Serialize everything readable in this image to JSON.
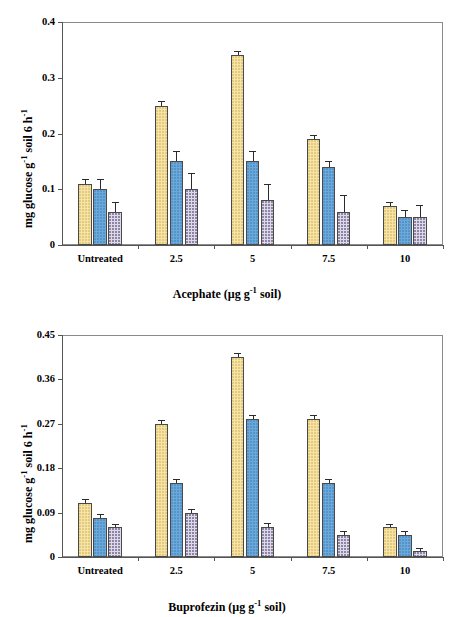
{
  "figure": {
    "series_names": [
      "Single application",
      "Two applications",
      "Three applications"
    ],
    "series_colors": [
      "#f7e3a6",
      "#6aa9dc",
      "#ded9e8"
    ],
    "categories": [
      "Untreated",
      "2.5",
      "5",
      "7.5",
      "10"
    ]
  },
  "chart_data": [
    {
      "type": "bar",
      "panel": "a",
      "title": "",
      "xlabel": "Acephate (µg g⁻¹ soil)",
      "ylabel": "mg glucose g⁻¹ soil 6 h⁻¹",
      "categories": [
        "Untreated",
        "2.5",
        "5",
        "7.5",
        "10"
      ],
      "ylim": [
        0,
        0.4
      ],
      "yticks": [
        0,
        0.1,
        0.2,
        0.3,
        0.4
      ],
      "ytick_labels": [
        "0",
        "0.1",
        "0.2",
        "0.3",
        "0.4"
      ],
      "grid": false,
      "legend_position": "top-left",
      "series": [
        {
          "name": "Single application",
          "color": "#f7e3a6",
          "values": [
            0.11,
            0.25,
            0.34,
            0.19,
            0.07
          ],
          "errors": [
            0.008,
            0.009,
            0.008,
            0.007,
            0.007
          ]
        },
        {
          "name": "Two applications",
          "color": "#6aa9dc",
          "values": [
            0.1,
            0.15,
            0.15,
            0.14,
            0.05
          ],
          "errors": [
            0.018,
            0.018,
            0.019,
            0.011,
            0.012
          ]
        },
        {
          "name": "Three applications",
          "color": "#ded9e8",
          "values": [
            0.06,
            0.1,
            0.08,
            0.06,
            0.05
          ]
        }
      ]
    },
    {
      "type": "bar",
      "panel": "b",
      "title": "",
      "xlabel": "Buprofezin (µg g⁻¹ soil)",
      "ylabel": "mg glucose g⁻¹ soil 6 h⁻¹",
      "categories": [
        "Untreated",
        "2.5",
        "5",
        "7.5",
        "10"
      ],
      "ylim": [
        0,
        0.45
      ],
      "yticks": [
        0,
        0.09,
        0.18,
        0.27,
        0.36,
        0.45
      ],
      "ytick_labels": [
        "0",
        "0.09",
        "0.18",
        "0.27",
        "0.36",
        "0.45"
      ],
      "grid": false,
      "legend_position": "top-left",
      "series": [
        {
          "name": "Single application",
          "color": "#f7e3a6",
          "values": [
            0.11,
            0.27,
            0.405,
            0.28,
            0.06
          ],
          "errors": [
            0.008,
            0.007,
            0.009,
            0.007,
            0.006
          ]
        },
        {
          "name": "Two applications",
          "color": "#6aa9dc",
          "values": [
            0.08,
            0.15,
            0.28,
            0.15,
            0.045
          ],
          "errors": [
            0.008,
            0.008,
            0.008,
            0.008,
            0.008
          ]
        },
        {
          "name": "Three applications",
          "color": "#ded9e8",
          "values": [
            0.06,
            0.09,
            0.06,
            0.045,
            0.012
          ],
          "errors": [
            0.007,
            0.007,
            0.008,
            0.007,
            0.007
          ]
        }
      ]
    }
  ],
  "panels": {
    "a": {
      "tag": "a"
    },
    "b": {
      "tag": "b"
    }
  }
}
